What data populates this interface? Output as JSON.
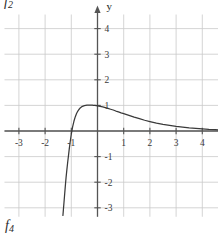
{
  "figure": {
    "top_label": "f",
    "top_label_sub": "2",
    "bottom_label": "f",
    "bottom_label_sub": "4",
    "background_color": "#ffffff",
    "grid_color": "#c9c9c9",
    "axis_color": "#555555",
    "curve_color": "#3a3a3a"
  },
  "chart_data": {
    "type": "line",
    "title": "",
    "subtitle": "",
    "xlabel": "x",
    "ylabel": "y",
    "xlim": [
      -3.55,
      4.75
    ],
    "ylim": [
      -3.35,
      4.55
    ],
    "grid": true,
    "grid_spacing": 1,
    "legend": "none",
    "axis_arrows": true,
    "xticks": [
      -3,
      -2,
      -1,
      1,
      2,
      3,
      4
    ],
    "xtick_labels": [
      "-3",
      "-2",
      "-1",
      "1",
      "2",
      "3",
      "4"
    ],
    "yticks": [
      4,
      3,
      2,
      1,
      -1,
      -2,
      -3
    ],
    "ytick_labels": [
      "4",
      "3",
      "2",
      "1",
      "-1",
      "-2",
      "-3"
    ],
    "series": [
      {
        "name": "curve",
        "x": [
          -1.32,
          -1.3,
          -1.28,
          -1.26,
          -1.24,
          -1.22,
          -1.2,
          -1.17,
          -1.14,
          -1.11,
          -1.08,
          -1.05,
          -1.0,
          -0.95,
          -0.9,
          -0.85,
          -0.8,
          -0.75,
          -0.7,
          -0.65,
          -0.6,
          -0.55,
          -0.5,
          -0.45,
          -0.4,
          -0.35,
          -0.3,
          -0.25,
          -0.2,
          -0.15,
          -0.1,
          -0.05,
          0.0,
          0.1,
          0.2,
          0.3,
          0.4,
          0.5,
          0.6,
          0.7,
          0.8,
          0.9,
          1.0,
          1.2,
          1.4,
          1.6,
          1.8,
          2.0,
          2.25,
          2.5,
          2.75,
          3.0,
          3.25,
          3.5,
          3.75,
          4.0,
          4.25,
          4.5,
          4.7
        ],
        "y": [
          -3.3,
          -3.05,
          -2.8,
          -2.55,
          -2.3,
          -2.05,
          -1.82,
          -1.52,
          -1.24,
          -0.98,
          -0.72,
          -0.48,
          -0.12,
          0.16,
          0.38,
          0.55,
          0.68,
          0.78,
          0.85,
          0.91,
          0.95,
          0.97,
          0.99,
          1.0,
          1.01,
          1.01,
          1.01,
          1.01,
          1.01,
          1.0,
          1.0,
          0.99,
          0.98,
          0.96,
          0.94,
          0.91,
          0.88,
          0.85,
          0.82,
          0.78,
          0.75,
          0.71,
          0.68,
          0.61,
          0.54,
          0.48,
          0.42,
          0.37,
          0.31,
          0.26,
          0.22,
          0.18,
          0.15,
          0.12,
          0.1,
          0.08,
          0.06,
          0.05,
          0.04
        ],
        "color": "#3a3a3a",
        "asymptote_left": -1.35,
        "asymptote_right": 0
      }
    ],
    "annotations": [
      {
        "text": "f",
        "sub": "2",
        "position": "top-left"
      },
      {
        "text": "f",
        "sub": "4",
        "position": "bottom-left"
      }
    ]
  }
}
